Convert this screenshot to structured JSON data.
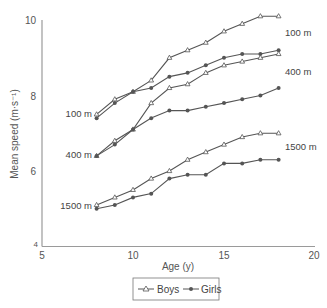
{
  "chart_data": {
    "type": "line",
    "title": "",
    "xlabel": "Age (y)",
    "ylabel": "Mean speed (m·s⁻¹)",
    "xlim": [
      5,
      20
    ],
    "ylim": [
      4,
      10
    ],
    "xticks": [
      5,
      10,
      15,
      20
    ],
    "yticks": [
      4,
      6,
      8,
      10
    ],
    "grid": false,
    "legend_position": "bottom-center",
    "legend": [
      {
        "name": "Boys",
        "marker": "open-triangle"
      },
      {
        "name": "Girls",
        "marker": "filled-circle"
      }
    ],
    "x": [
      8,
      9,
      10,
      11,
      12,
      13,
      14,
      15,
      16,
      17,
      18
    ],
    "series": [
      {
        "name": "Boys 100 m",
        "group": "Boys",
        "event": "100 m",
        "values": [
          7.5,
          7.9,
          8.1,
          8.4,
          9.0,
          9.2,
          9.4,
          9.7,
          9.9,
          10.1,
          10.1
        ]
      },
      {
        "name": "Girls 100 m",
        "group": "Girls",
        "event": "100 m",
        "values": [
          7.4,
          7.8,
          8.1,
          8.2,
          8.5,
          8.6,
          8.8,
          9.0,
          9.1,
          9.1,
          9.2
        ]
      },
      {
        "name": "Boys 400 m",
        "group": "Boys",
        "event": "400 m",
        "values": [
          6.4,
          6.8,
          7.1,
          7.8,
          8.2,
          8.3,
          8.6,
          8.8,
          8.9,
          9.0,
          9.1
        ]
      },
      {
        "name": "Girls 400 m",
        "group": "Girls",
        "event": "400 m",
        "values": [
          6.4,
          6.7,
          7.1,
          7.4,
          7.6,
          7.6,
          7.7,
          7.8,
          7.9,
          8.0,
          8.2
        ]
      },
      {
        "name": "Boys 1500 m",
        "group": "Boys",
        "event": "1500 m",
        "values": [
          5.1,
          5.3,
          5.5,
          5.8,
          6.0,
          6.3,
          6.5,
          6.7,
          6.9,
          7.0,
          7.0
        ]
      },
      {
        "name": "Girls 1500 m",
        "group": "Girls",
        "event": "1500 m",
        "values": [
          5.0,
          5.1,
          5.3,
          5.4,
          5.8,
          5.9,
          5.9,
          6.2,
          6.2,
          6.3,
          6.3
        ]
      }
    ],
    "annotations": [
      {
        "text": "100 m",
        "side": "left",
        "x": 92,
        "y": 117
      },
      {
        "text": "400 m",
        "side": "left",
        "x": 92,
        "y": 158
      },
      {
        "text": "1500 m",
        "side": "left",
        "x": 92,
        "y": 209
      },
      {
        "text": "100 m",
        "side": "right",
        "x": 285,
        "y": 36
      },
      {
        "text": "400 m",
        "side": "right",
        "x": 285,
        "y": 75
      },
      {
        "text": "1500 m",
        "side": "right",
        "x": 285,
        "y": 150
      }
    ]
  },
  "axes": {
    "x_title": "Age (y)",
    "y_title": "Mean speed (m·s⁻¹)",
    "x_tick_labels": [
      "5",
      "10",
      "15",
      "20"
    ],
    "y_tick_labels": [
      "4",
      "6",
      "8",
      "10"
    ]
  },
  "legend": {
    "boys_label": "Boys",
    "girls_label": "Girls"
  },
  "colors": {
    "line": "#555555",
    "axis": "#999999",
    "text": "#444444"
  }
}
